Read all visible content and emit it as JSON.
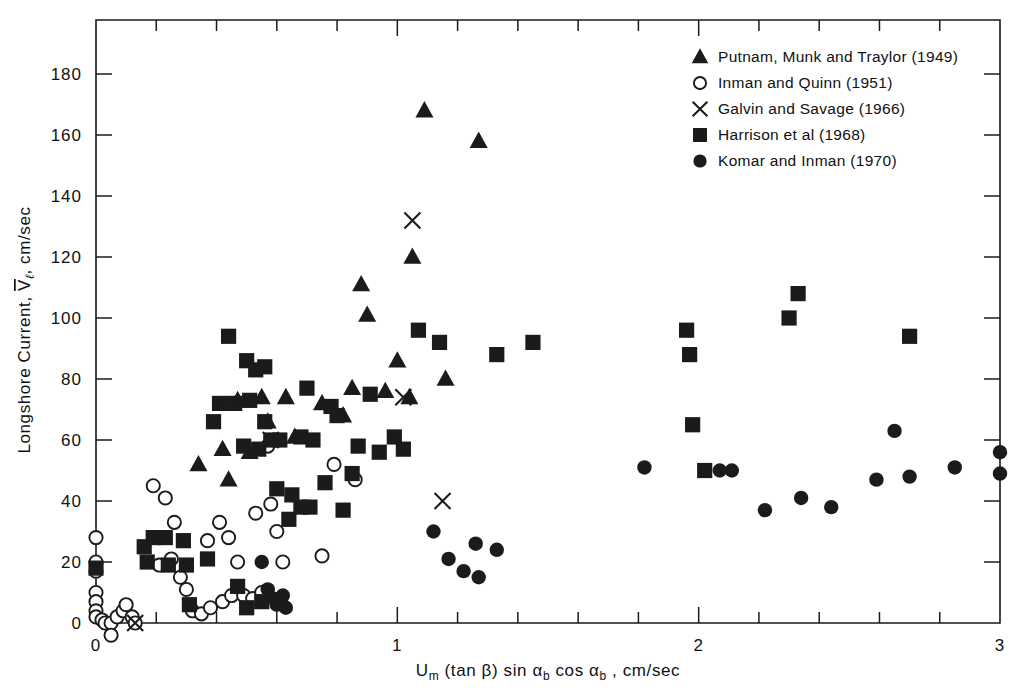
{
  "figure": {
    "background": "#ffffff",
    "ink_color": "#1b1b1b"
  },
  "axes": {
    "x_label": "U",
    "x_label_sub": "m",
    "x_label_rest": " (tan β)  sin α",
    "x_label_sub2": "b",
    "x_label_rest2": "  cos α",
    "x_label_sub3": "b",
    "x_label_rest3": " ,  cm/sec",
    "y_label_part1": "Longshore  Current,  ",
    "y_label_symbol": "V",
    "y_label_symbol_sub": "ℓ",
    "y_label_part2": ",  cm/sec",
    "x_ticklabels": [
      "0",
      "1",
      "2",
      "3"
    ],
    "y_ticklabels": [
      "0",
      "20",
      "40",
      "60",
      "80",
      "100",
      "120",
      "140",
      "160",
      "180"
    ]
  },
  "legend": {
    "entries": [
      {
        "marker": "triangle",
        "label": "Putnam, Munk and Traylor (1949)"
      },
      {
        "marker": "open-circle",
        "label": "Inman and Quinn (1951)"
      },
      {
        "marker": "cross",
        "label": "Galvin and  Savage (1966)"
      },
      {
        "marker": "square",
        "label": "Harrison  et al (1968)"
      },
      {
        "marker": "filled-circle",
        "label": "Komar and  Inman (1970)"
      }
    ]
  },
  "chart_data": {
    "type": "scatter",
    "title": "",
    "xlabel": "U_m (tan β) sin α_b cos α_b,  cm/sec",
    "ylabel": "Longshore Current, V̄_ℓ,  cm/sec",
    "xlim": [
      0,
      3
    ],
    "ylim": [
      0,
      195
    ],
    "xticks": [
      0,
      1,
      2,
      3
    ],
    "xminorticks": [
      0.2,
      0.4,
      0.6,
      0.8,
      1.2,
      1.4,
      1.6,
      1.8,
      2.2,
      2.4,
      2.6,
      2.8
    ],
    "yticks": [
      0,
      20,
      40,
      60,
      80,
      100,
      120,
      140,
      160,
      180
    ],
    "grid": false,
    "legend_position": "top-right",
    "series": [
      {
        "name": "Putnam, Munk and Traylor (1949)",
        "marker": "triangle",
        "points": [
          [
            1.09,
            168
          ],
          [
            1.27,
            158
          ],
          [
            1.05,
            120
          ],
          [
            0.88,
            111
          ],
          [
            0.9,
            101
          ],
          [
            1.0,
            86
          ],
          [
            1.16,
            80
          ],
          [
            0.85,
            77
          ],
          [
            0.96,
            76
          ],
          [
            1.04,
            74
          ],
          [
            0.63,
            74
          ],
          [
            0.55,
            74
          ],
          [
            0.47,
            73
          ],
          [
            0.34,
            52
          ],
          [
            0.42,
            57
          ],
          [
            0.51,
            56
          ],
          [
            0.57,
            66
          ],
          [
            0.75,
            72
          ],
          [
            0.82,
            68
          ],
          [
            0.66,
            61
          ],
          [
            0.44,
            47
          ]
        ]
      },
      {
        "name": "Inman and Quinn (1951)",
        "marker": "open-circle",
        "points": [
          [
            0.0,
            28
          ],
          [
            0.0,
            20
          ],
          [
            0.0,
            17
          ],
          [
            0.0,
            10
          ],
          [
            0.0,
            7
          ],
          [
            0.0,
            4
          ],
          [
            0.0,
            2
          ],
          [
            0.02,
            1
          ],
          [
            0.03,
            0
          ],
          [
            0.05,
            0
          ],
          [
            0.07,
            2
          ],
          [
            0.09,
            4
          ],
          [
            0.1,
            6
          ],
          [
            0.12,
            2
          ],
          [
            0.13,
            0
          ],
          [
            0.05,
            -4
          ],
          [
            0.19,
            45
          ],
          [
            0.23,
            41
          ],
          [
            0.26,
            33
          ],
          [
            0.25,
            21
          ],
          [
            0.21,
            19
          ],
          [
            0.28,
            15
          ],
          [
            0.3,
            11
          ],
          [
            0.32,
            4
          ],
          [
            0.35,
            3
          ],
          [
            0.38,
            5
          ],
          [
            0.42,
            7
          ],
          [
            0.45,
            9
          ],
          [
            0.37,
            27
          ],
          [
            0.41,
            33
          ],
          [
            0.44,
            28
          ],
          [
            0.47,
            20
          ],
          [
            0.49,
            9
          ],
          [
            0.52,
            8
          ],
          [
            0.55,
            10
          ],
          [
            0.53,
            36
          ],
          [
            0.58,
            39
          ],
          [
            0.6,
            30
          ],
          [
            0.57,
            58
          ],
          [
            0.62,
            20
          ],
          [
            0.75,
            22
          ],
          [
            0.79,
            52
          ],
          [
            0.86,
            47
          ]
        ]
      },
      {
        "name": "Galvin and Savage (1966)",
        "marker": "cross",
        "points": [
          [
            0.13,
            0
          ],
          [
            0.58,
            60
          ],
          [
            1.05,
            132
          ],
          [
            1.02,
            74
          ],
          [
            1.15,
            40
          ]
        ]
      },
      {
        "name": "Harrison et al (1968)",
        "marker": "square",
        "points": [
          [
            0.0,
            18
          ],
          [
            0.16,
            25
          ],
          [
            0.19,
            28
          ],
          [
            0.23,
            28
          ],
          [
            0.17,
            20
          ],
          [
            0.24,
            19
          ],
          [
            0.29,
            27
          ],
          [
            0.3,
            19
          ],
          [
            0.44,
            94
          ],
          [
            0.5,
            86
          ],
          [
            0.53,
            83
          ],
          [
            0.56,
            84
          ],
          [
            0.41,
            72
          ],
          [
            0.46,
            72
          ],
          [
            0.51,
            73
          ],
          [
            0.39,
            66
          ],
          [
            0.56,
            66
          ],
          [
            0.58,
            60
          ],
          [
            0.54,
            57
          ],
          [
            0.49,
            58
          ],
          [
            0.61,
            60
          ],
          [
            0.68,
            61
          ],
          [
            0.72,
            60
          ],
          [
            0.7,
            77
          ],
          [
            0.78,
            71
          ],
          [
            0.8,
            68
          ],
          [
            0.91,
            75
          ],
          [
            0.87,
            58
          ],
          [
            0.94,
            56
          ],
          [
            0.6,
            44
          ],
          [
            0.65,
            42
          ],
          [
            0.68,
            38
          ],
          [
            0.71,
            38
          ],
          [
            0.76,
            46
          ],
          [
            0.82,
            37
          ],
          [
            0.85,
            49
          ],
          [
            0.99,
            61
          ],
          [
            1.02,
            57
          ],
          [
            1.07,
            96
          ],
          [
            1.14,
            92
          ],
          [
            1.33,
            88
          ],
          [
            1.45,
            92
          ],
          [
            1.96,
            96
          ],
          [
            1.97,
            88
          ],
          [
            1.98,
            65
          ],
          [
            2.02,
            50
          ],
          [
            2.33,
            108
          ],
          [
            2.3,
            100
          ],
          [
            2.7,
            94
          ],
          [
            0.5,
            5
          ],
          [
            0.55,
            7
          ],
          [
            0.47,
            12
          ],
          [
            0.37,
            21
          ],
          [
            0.31,
            6
          ],
          [
            0.64,
            34
          ]
        ]
      },
      {
        "name": "Komar and Inman (1970)",
        "marker": "filled-circle",
        "points": [
          [
            0.55,
            20
          ],
          [
            0.57,
            11
          ],
          [
            0.59,
            8
          ],
          [
            0.6,
            6
          ],
          [
            0.62,
            9
          ],
          [
            0.63,
            5
          ],
          [
            1.12,
            30
          ],
          [
            1.17,
            21
          ],
          [
            1.22,
            17
          ],
          [
            1.27,
            15
          ],
          [
            1.26,
            26
          ],
          [
            1.33,
            24
          ],
          [
            1.82,
            51
          ],
          [
            2.07,
            50
          ],
          [
            2.11,
            50
          ],
          [
            2.22,
            37
          ],
          [
            2.34,
            41
          ],
          [
            2.44,
            38
          ],
          [
            2.59,
            47
          ],
          [
            2.7,
            48
          ],
          [
            2.65,
            63
          ],
          [
            2.85,
            51
          ],
          [
            3.0,
            56
          ],
          [
            3.0,
            49
          ]
        ]
      }
    ]
  }
}
